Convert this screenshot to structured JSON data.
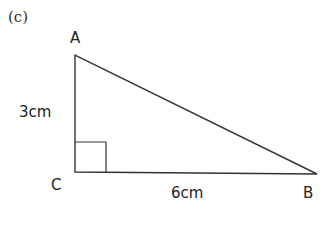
{
  "figure_label": "(c)",
  "vertices": {
    "A": {
      "label": "A"
    },
    "B": {
      "label": "B"
    },
    "C": {
      "label": "C"
    }
  },
  "sides": {
    "AC": {
      "label": "3cm"
    },
    "CB": {
      "label": "6cm"
    }
  },
  "right_angle_at": "C",
  "colors": {
    "stroke": "#333333",
    "text": "#222222"
  }
}
